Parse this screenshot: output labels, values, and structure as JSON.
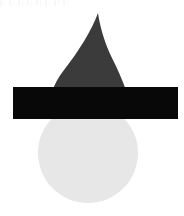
{
  "image": {
    "title": "Abstract Geometric Composition",
    "width": 184,
    "height": 216,
    "background_color": "#ffffff",
    "description": "Three overlapping flat shapes: a pale gray ellipse at the bottom, a dark gray teardrop/flame form above it, and a solid black horizontal bar crossing the middle."
  },
  "shapes": [
    {
      "id": "ellipse",
      "name": "light-gray-ellipse",
      "type": "ellipse",
      "color": "#e7e7e7",
      "center_x": 88,
      "center_y": 153,
      "radius_x": 50,
      "radius_y": 50,
      "z_order": 1,
      "label": "Ellipse"
    },
    {
      "id": "teardrop",
      "name": "dark-gray-teardrop",
      "type": "teardrop",
      "color": "#3b3b3b",
      "apex_x": 98,
      "apex_y": 13,
      "base_left_x": 47,
      "base_right_x": 133,
      "base_y": 118,
      "z_order": 2,
      "label": "Teardrop"
    },
    {
      "id": "bar",
      "name": "black-horizontal-bar",
      "type": "rectangle",
      "color": "#080808",
      "x": 13,
      "y": 87,
      "width": 165,
      "height": 32,
      "z_order": 3,
      "label": "Bar"
    }
  ],
  "artifacts": {
    "top_edge_noise": {
      "name": "scan-artifact",
      "color": "#c4c4c4",
      "visible": true
    }
  }
}
